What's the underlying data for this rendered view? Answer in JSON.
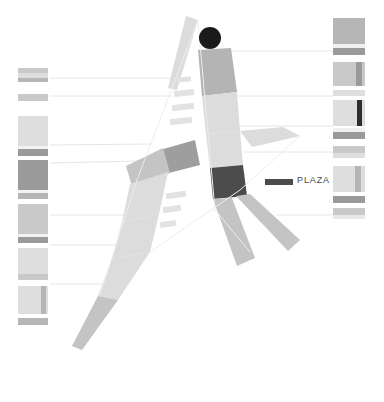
{
  "figure": {
    "title": "PLAZA",
    "background_color": "#ffffff"
  },
  "legend": {
    "items": [
      {
        "label": "PLAZA",
        "swatch_color": "#4c4c4c",
        "swatch_x": 265,
        "swatch_y": 179,
        "swatch_w": 28,
        "swatch_h": 6,
        "label_x": 297,
        "label_y": 175
      }
    ]
  },
  "colors": {
    "road_light": "#dcdcdc",
    "road_lighter": "#e4e4e4",
    "road_pale": "#e9e9e9",
    "road_mid": "#c4c4c4",
    "road_medium": "#b4b4b4",
    "road_dark": "#9e9e9e",
    "plaza_band": "#4c4c4c",
    "landmark_circle": "#1a1a1a",
    "leader_line": "#e6e6e6",
    "dash_mark": "#e2e2e2",
    "band_vlight": "#ededed",
    "band_light": "#dedede",
    "band_mid": "#c9c9c9",
    "band_medium": "#b6b6b6",
    "band_dark": "#9a9a9a",
    "band_darker": "#2e2e2e"
  },
  "map": {
    "landmark": {
      "name": "plaza-landmark-circle",
      "cx": 210,
      "cy": 38,
      "r": 11,
      "color": "#1a1a1a"
    },
    "roads": [
      {
        "name": "main-avenue-upper",
        "color": "#b4b4b4",
        "points": "198,50 231,48 237,92 202,96"
      },
      {
        "name": "main-avenue-mid-upper",
        "color": "#dcdcdc",
        "points": "202,96 237,92 240,131 206,134"
      },
      {
        "name": "main-avenue-mid",
        "color": "#dcdcdc",
        "points": "206,134 240,131 243,165 210,168"
      },
      {
        "name": "main-avenue-plaza-band",
        "color": "#4c4c4c",
        "points": "210,168 243,165 247,196 213,199"
      },
      {
        "name": "main-avenue-lower-left-branch",
        "color": "#c4c4c4",
        "points": "213,199 232,198 255,258 237,266"
      },
      {
        "name": "main-avenue-lower-right-branch",
        "color": "#c4c4c4",
        "points": "236,196 250,194 300,240 288,251"
      },
      {
        "name": "cross-street-east",
        "color": "#dcdcdc",
        "points": "240,131 283,127 300,136 252,147"
      },
      {
        "name": "cross-street-west-elbow",
        "color": "#9e9e9e",
        "points": "160,150 195,140 200,165 165,174"
      },
      {
        "name": "cross-street-west-arm",
        "color": "#c4c4c4",
        "points": "126,166 163,148 170,173 133,190"
      },
      {
        "name": "diagonal-road-upper",
        "color": "#dcdcdc",
        "points": "130,184 168,172 159,214 122,222"
      },
      {
        "name": "diagonal-road-mid",
        "color": "#dcdcdc",
        "points": "122,222 159,214 150,252 112,259"
      },
      {
        "name": "diagonal-road-lower",
        "color": "#dcdcdc",
        "points": "112,259 150,252 118,300 98,296"
      },
      {
        "name": "diagonal-road-tail",
        "color": "#c4c4c4",
        "points": "98,296 118,300 82,350 72,346"
      },
      {
        "name": "northwest-spur",
        "color": "#dcdcdc",
        "points": "186,16 198,20 177,90 168,88"
      }
    ],
    "dash_marks": [
      {
        "name": "side-street-dash-1",
        "x": 177,
        "y": 77,
        "w": 14,
        "h": 5,
        "angle": -6
      },
      {
        "name": "side-street-dash-2",
        "x": 174,
        "y": 90,
        "w": 20,
        "h": 6,
        "angle": -6
      },
      {
        "name": "side-street-dash-3",
        "x": 172,
        "y": 104,
        "w": 22,
        "h": 6,
        "angle": -6
      },
      {
        "name": "side-street-dash-4",
        "x": 170,
        "y": 118,
        "w": 22,
        "h": 6,
        "angle": -6
      },
      {
        "name": "side-street-dash-5",
        "x": 166,
        "y": 192,
        "w": 20,
        "h": 6,
        "angle": -8
      },
      {
        "name": "side-street-dash-6",
        "x": 163,
        "y": 206,
        "w": 18,
        "h": 6,
        "angle": -8
      },
      {
        "name": "side-street-dash-7",
        "x": 160,
        "y": 221,
        "w": 16,
        "h": 6,
        "angle": -8
      }
    ],
    "leader_lines": [
      {
        "name": "leader-line-left-1",
        "x1": 50,
        "y1": 78,
        "x2": 178,
        "y2": 78
      },
      {
        "name": "leader-line-left-2",
        "x1": 50,
        "y1": 96,
        "x2": 172,
        "y2": 96
      },
      {
        "name": "leader-line-left-3",
        "x1": 50,
        "y1": 145,
        "x2": 152,
        "y2": 144
      },
      {
        "name": "leader-line-left-4",
        "x1": 50,
        "y1": 163,
        "x2": 140,
        "y2": 161
      },
      {
        "name": "leader-line-left-5",
        "x1": 50,
        "y1": 215,
        "x2": 128,
        "y2": 215
      },
      {
        "name": "leader-line-left-6",
        "x1": 50,
        "y1": 245,
        "x2": 120,
        "y2": 245
      },
      {
        "name": "leader-line-left-7",
        "x1": 50,
        "y1": 284,
        "x2": 107,
        "y2": 284
      },
      {
        "name": "leader-line-right-1",
        "x1": 228,
        "y1": 51,
        "x2": 333,
        "y2": 51
      },
      {
        "name": "leader-line-right-2",
        "x1": 234,
        "y1": 96,
        "x2": 333,
        "y2": 96
      },
      {
        "name": "leader-line-right-3",
        "x1": 239,
        "y1": 126,
        "x2": 333,
        "y2": 126
      },
      {
        "name": "leader-line-right-4",
        "x1": 244,
        "y1": 152,
        "x2": 333,
        "y2": 152
      },
      {
        "name": "leader-line-right-5",
        "x1": 276,
        "y1": 215,
        "x2": 333,
        "y2": 215
      }
    ],
    "thin_outlines": [
      {
        "name": "block-outline-west",
        "points": "198,20 137,180 100,295"
      },
      {
        "name": "block-outline-east",
        "points": "198,22 215,210 250,252"
      },
      {
        "name": "block-outline-diagonal",
        "points": "150,252 240,190 300,136"
      }
    ]
  },
  "left_column": {
    "name": "left-legend-column",
    "x": 18,
    "width": 30,
    "bands": [
      {
        "name": "band",
        "y": 68,
        "h": 5,
        "color": "#c9c9c9"
      },
      {
        "name": "band",
        "y": 73,
        "h": 5,
        "color": "#dedede"
      },
      {
        "name": "band",
        "y": 78,
        "h": 4,
        "color": "#b6b6b6"
      },
      {
        "name": "band",
        "y": 94,
        "h": 7,
        "color": "#c9c9c9"
      },
      {
        "name": "band",
        "y": 116,
        "h": 30,
        "color": "#dedede"
      },
      {
        "name": "band",
        "y": 146,
        "h": 3,
        "color": "#f2f2f2"
      },
      {
        "name": "band",
        "y": 149,
        "h": 7,
        "color": "#9a9a9a"
      },
      {
        "name": "band",
        "y": 160,
        "h": 30,
        "color": "#9a9a9a"
      },
      {
        "name": "band",
        "y": 190,
        "h": 3,
        "color": "#f2f2f2"
      },
      {
        "name": "band",
        "y": 193,
        "h": 6,
        "color": "#b6b6b6"
      },
      {
        "name": "band",
        "y": 204,
        "h": 30,
        "color": "#c9c9c9"
      },
      {
        "name": "band",
        "y": 234,
        "h": 3,
        "color": "#f2f2f2"
      },
      {
        "name": "band",
        "y": 237,
        "h": 6,
        "color": "#9a9a9a"
      },
      {
        "name": "band",
        "y": 248,
        "h": 26,
        "color": "#dedede"
      },
      {
        "name": "band",
        "y": 274,
        "h": 6,
        "color": "#c9c9c9"
      },
      {
        "name": "band",
        "y": 286,
        "h": 28,
        "color": "#dedede"
      },
      {
        "name": "band",
        "y": 318,
        "h": 7,
        "color": "#b6b6b6"
      }
    ],
    "accents": [
      {
        "name": "band-accent",
        "x": 41,
        "y": 286,
        "w": 5,
        "h": 28,
        "color": "#b6b6b6"
      }
    ]
  },
  "right_column": {
    "name": "right-legend-column",
    "x": 333,
    "width": 32,
    "bands": [
      {
        "name": "band",
        "y": 18,
        "h": 26,
        "color": "#b6b6b6"
      },
      {
        "name": "band",
        "y": 44,
        "h": 4,
        "color": "#f0f0f0"
      },
      {
        "name": "band",
        "y": 48,
        "h": 7,
        "color": "#9a9a9a"
      },
      {
        "name": "band",
        "y": 62,
        "h": 24,
        "color": "#c9c9c9"
      },
      {
        "name": "band",
        "y": 90,
        "h": 6,
        "color": "#dedede"
      },
      {
        "name": "band",
        "y": 100,
        "h": 26,
        "color": "#dedede"
      },
      {
        "name": "band",
        "y": 128,
        "h": 4,
        "color": "#f0f0f0"
      },
      {
        "name": "band",
        "y": 132,
        "h": 7,
        "color": "#9a9a9a"
      },
      {
        "name": "band",
        "y": 146,
        "h": 7,
        "color": "#c9c9c9"
      },
      {
        "name": "band",
        "y": 153,
        "h": 5,
        "color": "#dedede"
      },
      {
        "name": "band",
        "y": 166,
        "h": 26,
        "color": "#dedede"
      },
      {
        "name": "band",
        "y": 196,
        "h": 7,
        "color": "#9a9a9a"
      },
      {
        "name": "band",
        "y": 208,
        "h": 7,
        "color": "#c9c9c9"
      },
      {
        "name": "band",
        "y": 215,
        "h": 4,
        "color": "#e8e8e8"
      }
    ],
    "accents": [
      {
        "name": "band-accent",
        "x": 356,
        "y": 62,
        "w": 6,
        "h": 24,
        "color": "#9a9a9a"
      },
      {
        "name": "band-accent",
        "x": 357,
        "y": 100,
        "w": 5,
        "h": 26,
        "color": "#2e2e2e"
      },
      {
        "name": "band-accent",
        "x": 355,
        "y": 166,
        "w": 6,
        "h": 26,
        "color": "#b6b6b6"
      }
    ]
  }
}
